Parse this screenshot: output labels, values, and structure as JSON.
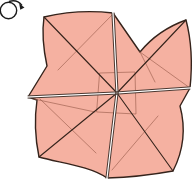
{
  "icons": {
    "rotate": "circular-rotate-arrow"
  },
  "colors": {
    "background": "#ffffff",
    "paper": "#f5b1a1",
    "outline": "#35231b",
    "crease": "#9c5f4d",
    "open_edge": "#ffffff",
    "icon_stroke": "#1c1c1c"
  }
}
